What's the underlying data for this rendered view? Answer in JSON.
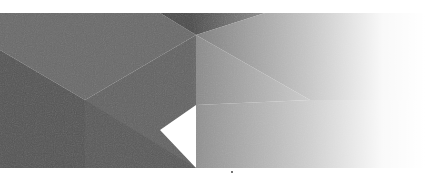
{
  "image": {
    "kind": "abstract-geometric-banner",
    "description": "Faceted gray low-poly pattern fading to white on the right",
    "band_top_height": 13,
    "band_bottom_start": 168,
    "colors": {
      "background": "#ffffff",
      "facet_darkest": "#4f4f4f",
      "facet_dark": "#5c5c5c",
      "facet_mid": "#6e6e6e",
      "facet_mid_light": "#7a7a7a",
      "facet_light": "#8c8c8c",
      "facet_lighter": "#9a9a9a",
      "fade_end": "#ffffff"
    },
    "facets": [
      {
        "name": "top-left-field",
        "points": "0,13 160,13 196,35 85,100 0,50",
        "fill": "#6a6a6a"
      },
      {
        "name": "left-lower-dark",
        "points": "0,50 85,100 85,168 0,168",
        "fill": "#555555"
      },
      {
        "name": "center-diag-band",
        "points": "85,100 196,35 196,105 160,130 196,168 85,168",
        "fill": "#646464"
      },
      {
        "name": "center-lower",
        "points": "85,100 196,168 85,168",
        "fill": "#5a5a5a"
      },
      {
        "name": "top-notch-dark",
        "points": "160,13 265,13 196,35",
        "fill": "#4c4c4c"
      },
      {
        "name": "right-upper",
        "points": "196,35 265,13 425,13 425,100 310,100",
        "fill": "#7c7c7c"
      },
      {
        "name": "right-middle",
        "points": "196,35 310,100 196,105",
        "fill": "#888888"
      },
      {
        "name": "right-lower",
        "points": "196,105 310,100 425,100 425,168 196,168",
        "fill": "#8e8e8e"
      }
    ],
    "marker_dot": {
      "x": 232,
      "y": 172,
      "r": 0.9,
      "fill": "#333333"
    }
  }
}
